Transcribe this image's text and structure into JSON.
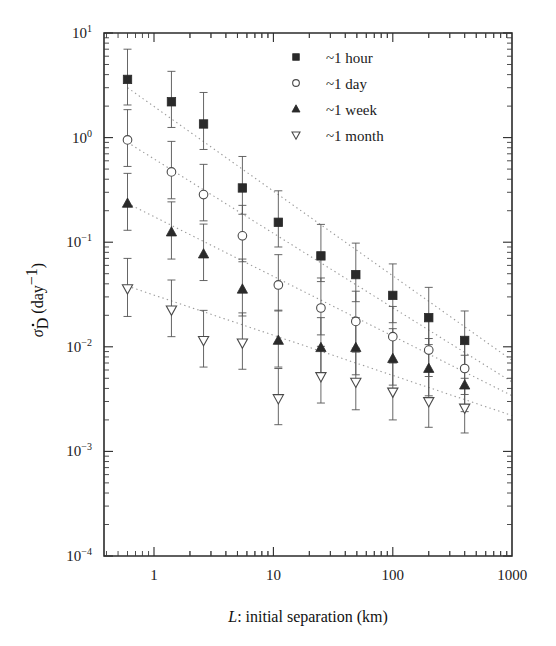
{
  "chart_data": {
    "type": "scatter",
    "title": "",
    "xlabel": "L: initial separation (km)",
    "xlabel_italic_part": "L",
    "xlabel_rest": ": initial separation (km)",
    "ylabel": "σ̇_D (day⁻¹)",
    "ylabel_parts": {
      "sigma": "σ",
      "dot": "˙",
      "sub": "D",
      "unit": "(day",
      "exp": "−1",
      "close": ")"
    },
    "xscale": "log",
    "yscale": "log",
    "xlim": [
      0.45,
      1000
    ],
    "ylim": [
      0.0001,
      10
    ],
    "xticks": [
      1,
      10,
      100,
      1000
    ],
    "xtick_labels": [
      "1",
      "10",
      "100",
      "1000"
    ],
    "yticks": [
      10,
      1,
      0.1,
      0.01,
      0.001,
      0.0001
    ],
    "ytick_labels": [
      "10¹",
      "10⁰",
      "10⁻¹",
      "10⁻²",
      "10⁻³",
      "10⁻⁴"
    ],
    "ytick_mantissa": "10",
    "ytick_exponents": [
      "1",
      "0",
      "−1",
      "−2",
      "−3",
      "−4"
    ],
    "grid": false,
    "legend_position": "top-right",
    "x": [
      0.6,
      1.4,
      2.6,
      5.5,
      11,
      25,
      49,
      100,
      200,
      400
    ],
    "series": [
      {
        "name": "~1 hour",
        "marker": "filled-square",
        "values": [
          3.6,
          2.2,
          1.35,
          0.33,
          0.155,
          0.074,
          0.049,
          0.031,
          0.019,
          0.0115
        ],
        "err_low": [
          1.55,
          0.95,
          0.58,
          0.145,
          0.065,
          0.032,
          0.022,
          0.014,
          0.0085,
          0.0052
        ],
        "err_high": [
          3.4,
          2.1,
          1.35,
          0.33,
          0.155,
          0.074,
          0.049,
          0.031,
          0.018,
          0.0105
        ]
      },
      {
        "name": "~1 day",
        "marker": "open-circle",
        "values": [
          0.95,
          0.47,
          0.285,
          0.115,
          0.039,
          0.0235,
          0.0175,
          0.0125,
          0.0093,
          0.0062
        ],
        "err_low": [
          0.42,
          0.21,
          0.125,
          0.05,
          0.017,
          0.0105,
          0.0078,
          0.0055,
          0.0041,
          0.0027
        ],
        "err_high": [
          0.9,
          0.45,
          0.27,
          0.11,
          0.037,
          0.022,
          0.0165,
          0.0118,
          0.0087,
          0.0058
        ]
      },
      {
        "name": "~1 week",
        "marker": "filled-triangle-up",
        "values": [
          0.235,
          0.125,
          0.077,
          0.0355,
          0.0115,
          0.0098,
          0.0098,
          0.0077,
          0.0062,
          0.0043
        ],
        "err_low": [
          0.105,
          0.056,
          0.034,
          0.0158,
          0.0051,
          0.0044,
          0.0044,
          0.0034,
          0.0028,
          0.0019
        ],
        "err_high": [
          0.22,
          0.118,
          0.072,
          0.0335,
          0.0109,
          0.0092,
          0.0092,
          0.0072,
          0.0058,
          0.004
        ]
      },
      {
        "name": "~1 month",
        "marker": "open-triangle-down",
        "values": [
          0.036,
          0.0225,
          0.0115,
          0.0109,
          0.0032,
          0.0052,
          0.0046,
          0.0037,
          0.003,
          0.0026
        ],
        "err_low": [
          0.0165,
          0.01,
          0.0051,
          0.0048,
          0.0014,
          0.0023,
          0.0021,
          0.0017,
          0.0013,
          0.0011
        ],
        "err_high": [
          0.034,
          0.021,
          0.0108,
          0.0102,
          0.003,
          0.0049,
          0.0043,
          0.0035,
          0.0028,
          0.0024
        ]
      }
    ],
    "trend_lines": [
      {
        "name": "~1 hour fit",
        "x0": 0.6,
        "y0": 3.0,
        "x1": 1000,
        "y1": 0.0074,
        "style": "dotted"
      },
      {
        "name": "~1 day fit",
        "x0": 0.6,
        "y0": 0.9,
        "x1": 1000,
        "y1": 0.0046,
        "style": "dotted"
      },
      {
        "name": "~1 week fit",
        "x0": 0.6,
        "y0": 0.235,
        "x1": 1000,
        "y1": 0.0034,
        "style": "dotted"
      },
      {
        "name": "~1 month fit",
        "x0": 0.6,
        "y0": 0.038,
        "x1": 1000,
        "y1": 0.0022,
        "style": "dotted"
      }
    ]
  },
  "legend": {
    "items": [
      {
        "label": "~1 hour",
        "marker": "filled-square"
      },
      {
        "label": "~1 day",
        "marker": "open-circle"
      },
      {
        "label": "~1 week",
        "marker": "filled-triangle-up"
      },
      {
        "label": "~1 month",
        "marker": "open-triangle-down"
      }
    ]
  },
  "colors": {
    "axis": "#2b2b2b",
    "marker_fill": "#2a2a2a",
    "marker_open": "#ffffff",
    "errorbar": "#555555",
    "trend": "#9a9a9a",
    "background": "#ffffff"
  }
}
